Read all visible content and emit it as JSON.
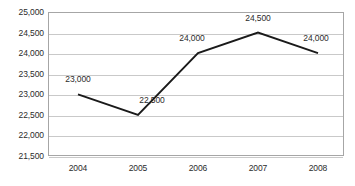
{
  "chart_data": {
    "type": "line",
    "title": "",
    "subtitle": "",
    "xlabel": "",
    "ylabel": "",
    "categories": [
      "2004",
      "2005",
      "2006",
      "2007",
      "2008"
    ],
    "values": [
      23000,
      22500,
      24000,
      24500,
      24000
    ],
    "point_labels": [
      "23,000",
      "22,500",
      "24,000",
      "24,500",
      "24,000"
    ],
    "ylim": [
      21500,
      25000
    ],
    "ytick_step": 500,
    "ytick_labels": [
      "25,000",
      "24,500",
      "24,000",
      "23,500",
      "23,000",
      "22,500",
      "22,000",
      "21,500"
    ],
    "ytick_values": [
      25000,
      24500,
      24000,
      23500,
      23000,
      22500,
      22000,
      21500
    ],
    "grid": true,
    "legend": false,
    "legend_position": "none",
    "series": [
      {
        "name": "",
        "values": [
          23000,
          22500,
          24000,
          24500,
          24000
        ]
      }
    ],
    "colors": {
      "line": "#1a1a1a",
      "gridline": "#c9c9c9",
      "plot_border": "#a6a6a6",
      "background": "#ffffff",
      "text": "#2b2b2b"
    },
    "label_offsets": [
      {
        "dx": 0,
        "dy": -10,
        "align": "center"
      },
      {
        "dx": 14,
        "dy": -10,
        "align": "center"
      },
      {
        "dx": -6,
        "dy": -10,
        "align": "center"
      },
      {
        "dx": 0,
        "dy": -10,
        "align": "center"
      },
      {
        "dx": -2,
        "dy": -10,
        "align": "center"
      }
    ]
  }
}
